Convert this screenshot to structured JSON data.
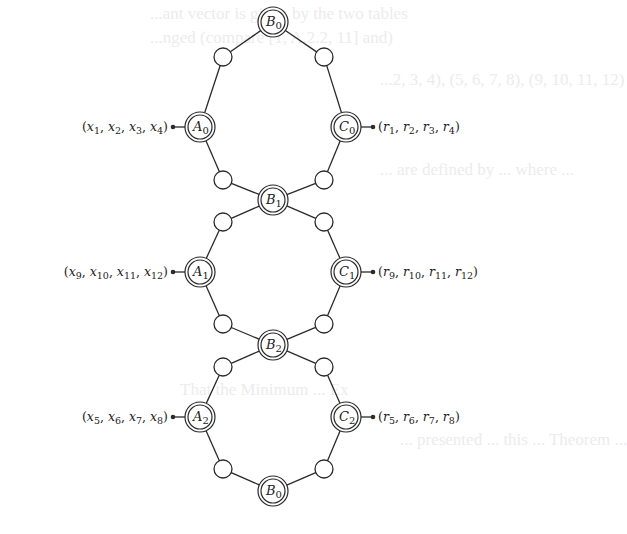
{
  "diagram": {
    "colors": {
      "stroke": "#2a2a2a",
      "background": "#ffffff",
      "ghost_text": "#ececec"
    },
    "nodes": [
      {
        "id": "B0_top",
        "base": "B",
        "sub": "0",
        "x": 273,
        "y": 22
      },
      {
        "id": "A0",
        "base": "A",
        "sub": "0",
        "x": 200,
        "y": 127
      },
      {
        "id": "C0",
        "base": "C",
        "sub": "0",
        "x": 346,
        "y": 127
      },
      {
        "id": "B1",
        "base": "B",
        "sub": "1",
        "x": 273,
        "y": 200
      },
      {
        "id": "A1",
        "base": "A",
        "sub": "1",
        "x": 200,
        "y": 272
      },
      {
        "id": "C1",
        "base": "C",
        "sub": "1",
        "x": 346,
        "y": 272
      },
      {
        "id": "B2",
        "base": "B",
        "sub": "2",
        "x": 273,
        "y": 345
      },
      {
        "id": "A2",
        "base": "A",
        "sub": "2",
        "x": 200,
        "y": 417
      },
      {
        "id": "C2",
        "base": "C",
        "sub": "2",
        "x": 346,
        "y": 417
      },
      {
        "id": "B0_bottom",
        "base": "B",
        "sub": "0",
        "x": 273,
        "y": 491
      }
    ],
    "relay_nodes": [
      {
        "id": "r1",
        "x": 223,
        "y": 57
      },
      {
        "id": "r2",
        "x": 324,
        "y": 57
      },
      {
        "id": "r3",
        "x": 223,
        "y": 180
      },
      {
        "id": "r4",
        "x": 324,
        "y": 180
      },
      {
        "id": "r5",
        "x": 223,
        "y": 222
      },
      {
        "id": "r6",
        "x": 324,
        "y": 222
      },
      {
        "id": "r7",
        "x": 223,
        "y": 324
      },
      {
        "id": "r8",
        "x": 324,
        "y": 324
      },
      {
        "id": "r9",
        "x": 223,
        "y": 367
      },
      {
        "id": "r10",
        "x": 324,
        "y": 367
      },
      {
        "id": "r11",
        "x": 223,
        "y": 469
      },
      {
        "id": "r12",
        "x": 324,
        "y": 469
      }
    ],
    "edges": [
      [
        "B0_top",
        "r1"
      ],
      [
        "r1",
        "A0"
      ],
      [
        "B0_top",
        "r2"
      ],
      [
        "r2",
        "C0"
      ],
      [
        "A0",
        "r3"
      ],
      [
        "r3",
        "B1"
      ],
      [
        "C0",
        "r4"
      ],
      [
        "r4",
        "B1"
      ],
      [
        "B1",
        "r5"
      ],
      [
        "r5",
        "A1"
      ],
      [
        "B1",
        "r6"
      ],
      [
        "r6",
        "C1"
      ],
      [
        "A1",
        "r7"
      ],
      [
        "r7",
        "B2"
      ],
      [
        "C1",
        "r8"
      ],
      [
        "r8",
        "B2"
      ],
      [
        "B2",
        "r9"
      ],
      [
        "r9",
        "A2"
      ],
      [
        "B2",
        "r10"
      ],
      [
        "r10",
        "C2"
      ],
      [
        "A2",
        "r11"
      ],
      [
        "r11",
        "B0_bottom"
      ],
      [
        "C2",
        "r12"
      ],
      [
        "r12",
        "B0_bottom"
      ]
    ],
    "io_labels": [
      {
        "id": "in0",
        "attach": "A0",
        "side": "left",
        "vars": "x",
        "subs": [
          "1",
          "2",
          "3",
          "4"
        ]
      },
      {
        "id": "out0",
        "attach": "C0",
        "side": "right",
        "vars": "r",
        "subs": [
          "1",
          "2",
          "3",
          "4"
        ]
      },
      {
        "id": "in1",
        "attach": "A1",
        "side": "left",
        "vars": "x",
        "subs": [
          "9",
          "10",
          "11",
          "12"
        ]
      },
      {
        "id": "out1",
        "attach": "C1",
        "side": "right",
        "vars": "r",
        "subs": [
          "9",
          "10",
          "11",
          "12"
        ]
      },
      {
        "id": "in2",
        "attach": "A2",
        "side": "left",
        "vars": "x",
        "subs": [
          "5",
          "6",
          "7",
          "8"
        ]
      },
      {
        "id": "out2",
        "attach": "C2",
        "side": "right",
        "vars": "r",
        "subs": [
          "5",
          "6",
          "7",
          "8"
        ]
      }
    ]
  },
  "ghost_text": [
    {
      "text": "...ant vector is given by the two tables",
      "x": 150,
      "y": 4
    },
    {
      "text": "...nged (compare [1, A.2.2, 11] and)",
      "x": 150,
      "y": 28
    },
    {
      "text": "...2, 3, 4), (5, 6, 7, 8), (9, 10, 11, 12)",
      "x": 380,
      "y": 70
    },
    {
      "text": "... are defined by ... where ...",
      "x": 380,
      "y": 160
    },
    {
      "text": "That the Minimum ... Ex",
      "x": 180,
      "y": 380
    },
    {
      "text": "... presented ... this ... Theorem ...",
      "x": 400,
      "y": 430
    }
  ]
}
